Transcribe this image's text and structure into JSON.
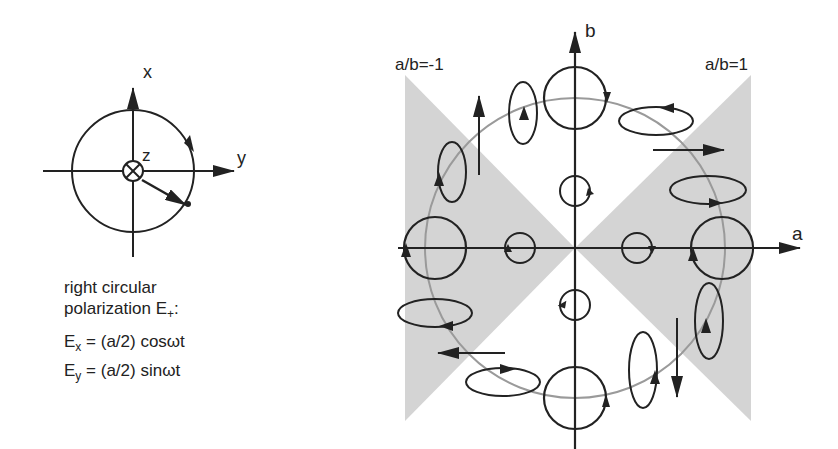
{
  "left_panel": {
    "axis_labels": {
      "x": "x",
      "y": "y",
      "z": "z"
    },
    "caption_line1": "right circular",
    "caption_line2": "polarization E",
    "caption_sub": "+",
    "caption_suffix": ":",
    "equations": [
      {
        "lhs": "E",
        "sub": "x",
        "rhs": " = (a/2) cosωt"
      },
      {
        "lhs": "E",
        "sub": "y",
        "rhs": " = (a/2) sinωt"
      }
    ]
  },
  "right_panel": {
    "axis_labels": {
      "a": "a",
      "b": "b"
    },
    "region_labels": {
      "left": "a/b=-1",
      "right": "a/b=1"
    },
    "colors": {
      "shade": "#d4d4d4",
      "circle_path": "#9a9a9a",
      "ink": "#222222"
    }
  }
}
